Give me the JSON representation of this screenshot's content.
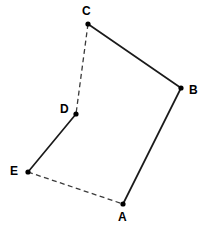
{
  "figure": {
    "width": 207,
    "height": 231,
    "background_color": "#ffffff",
    "line_color": "#1a1a1a",
    "dash_color": "#3a3a3a",
    "vertex_color": "#000000",
    "vertices": [
      {
        "id": "A",
        "label": "A",
        "x": 123,
        "y": 204,
        "label_x": 118,
        "label_y": 211,
        "label_anchor": "below"
      },
      {
        "id": "B",
        "label": "B",
        "x": 181,
        "y": 88,
        "label_x": 189,
        "label_y": 84,
        "label_anchor": "right"
      },
      {
        "id": "C",
        "label": "C",
        "x": 88,
        "y": 24,
        "label_x": 82,
        "label_y": 5,
        "label_anchor": "above"
      },
      {
        "id": "D",
        "label": "D",
        "x": 76,
        "y": 114,
        "label_x": 60,
        "label_y": 103,
        "label_anchor": "left"
      },
      {
        "id": "E",
        "label": "E",
        "x": 28,
        "y": 172,
        "label_x": 10,
        "label_y": 165,
        "label_anchor": "left"
      }
    ],
    "edges": [
      {
        "id": "edge-CB",
        "from": "C",
        "to": "B",
        "style": "solid",
        "x1": 88,
        "y1": 24,
        "x2": 181,
        "y2": 88
      },
      {
        "id": "edge-BA",
        "from": "B",
        "to": "A",
        "style": "solid",
        "x1": 181,
        "y1": 88,
        "x2": 123,
        "y2": 204
      },
      {
        "id": "edge-DE",
        "from": "D",
        "to": "E",
        "style": "solid",
        "x1": 76,
        "y1": 114,
        "x2": 28,
        "y2": 172
      },
      {
        "id": "edge-CD",
        "from": "C",
        "to": "D",
        "style": "dashed",
        "x1": 88,
        "y1": 24,
        "x2": 76,
        "y2": 114
      },
      {
        "id": "edge-EA",
        "from": "E",
        "to": "A",
        "style": "dashed",
        "x1": 28,
        "y1": 172,
        "x2": 123,
        "y2": 204
      }
    ]
  }
}
